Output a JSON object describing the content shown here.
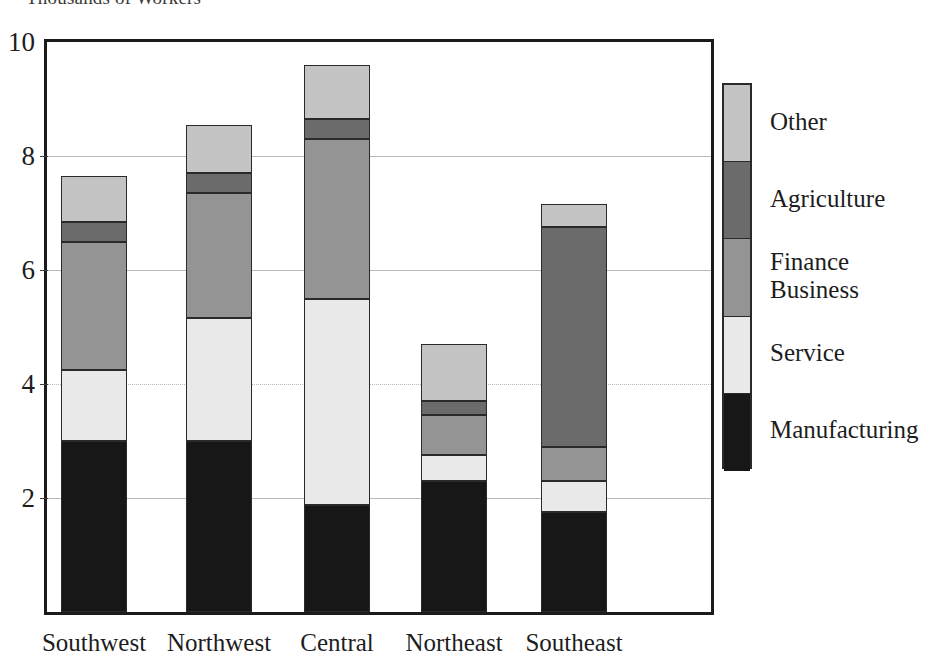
{
  "chart_data": {
    "type": "bar",
    "subtype": "stacked-vertical",
    "title": "Thousands of Workers",
    "xlabel": "",
    "ylabel": "",
    "ylim": [
      0,
      10
    ],
    "yticks": [
      2,
      4,
      6,
      8,
      10
    ],
    "ytick_labels": [
      "2",
      "4",
      "6",
      "8",
      "10"
    ],
    "grid": true,
    "legend_position": "right",
    "categories": [
      "Southwest",
      "Northwest",
      "Central",
      "Northeast",
      "Southeast"
    ],
    "series": [
      {
        "name": "Manufacturing",
        "color": "#171717",
        "values": [
          3.0,
          3.0,
          1.87,
          2.3,
          1.75
        ]
      },
      {
        "name": "Service",
        "color": "#e9e9e9",
        "values": [
          1.25,
          2.15,
          3.63,
          0.45,
          0.55
        ]
      },
      {
        "name": "Finance Business",
        "color": "#949494",
        "values": [
          2.25,
          2.2,
          2.8,
          0.7,
          0.6
        ]
      },
      {
        "name": "Agriculture",
        "color": "#6b6b6b",
        "values": [
          0.35,
          0.35,
          0.35,
          0.25,
          3.85
        ]
      },
      {
        "name": "Other",
        "color": "#c4c4c4",
        "values": [
          0.8,
          0.85,
          0.95,
          1.0,
          0.4
        ]
      }
    ],
    "totals": [
      7.65,
      8.55,
      9.6,
      4.7,
      7.15
    ],
    "cumulative_tops": [
      [
        3.0,
        4.25,
        6.5,
        6.85,
        7.65
      ],
      [
        3.0,
        5.15,
        7.35,
        7.7,
        8.55
      ],
      [
        1.87,
        5.5,
        8.3,
        8.65,
        9.6
      ],
      [
        2.3,
        2.75,
        3.45,
        3.7,
        4.7
      ],
      [
        1.75,
        2.3,
        2.9,
        6.75,
        7.15
      ]
    ]
  },
  "legend": {
    "entries": [
      {
        "label": "Other",
        "color": "#c4c4c4"
      },
      {
        "label": "Agriculture",
        "color": "#6b6b6b"
      },
      {
        "label": "Finance\nBusiness",
        "color": "#949494"
      },
      {
        "label": "Service",
        "color": "#e9e9e9"
      },
      {
        "label": "Manufacturing",
        "color": "#171717"
      }
    ]
  },
  "axis": {
    "y_max_label": "10",
    "y_labels": [
      "10",
      "8",
      "6",
      "4",
      "2"
    ]
  }
}
